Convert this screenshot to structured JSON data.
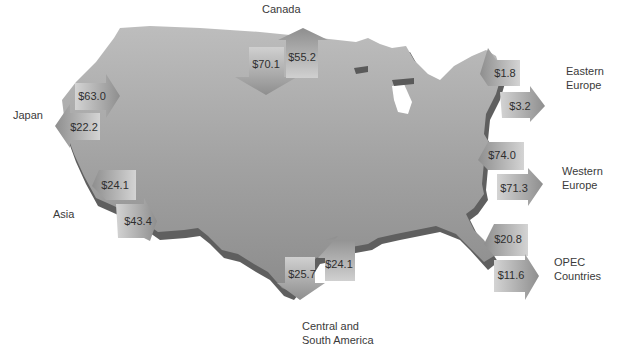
{
  "colors": {
    "map_top_light": "#b9b9b9",
    "map_top_dark": "#8f8f8f",
    "map_edge": "#6a6a6a",
    "arrow_light": "#d2d2d2",
    "arrow_dark": "#8c8c8c",
    "text": "#3a3a3a"
  },
  "regions": {
    "canada": {
      "label": "Canada"
    },
    "japan": {
      "label": "Japan"
    },
    "asia": {
      "label": "Asia"
    },
    "eastern_europe": {
      "label_line1": "Eastern",
      "label_line2": "Europe"
    },
    "western_europe": {
      "label_line1": "Western",
      "label_line2": "Europe"
    },
    "opec": {
      "label_line1": "OPEC",
      "label_line2": "Countries"
    },
    "latin_america": {
      "label_line1": "Central and",
      "label_line2": "South America"
    }
  },
  "arrows": [
    {
      "region": "Canada",
      "direction": "into US (imports)",
      "value": "$70.1"
    },
    {
      "region": "Canada",
      "direction": "out of US (exports)",
      "value": "$55.2"
    },
    {
      "region": "Japan",
      "direction": "into US (imports)",
      "value": "$63.0"
    },
    {
      "region": "Japan",
      "direction": "out of US (exports)",
      "value": "$22.2"
    },
    {
      "region": "Asia",
      "direction": "out of US (exports)",
      "value": "$24.1"
    },
    {
      "region": "Asia",
      "direction": "into US (imports)",
      "value": "$43.4"
    },
    {
      "region": "Eastern Europe",
      "direction": "into US (imports)",
      "value": "$1.8"
    },
    {
      "region": "Eastern Europe",
      "direction": "out of US (exports)",
      "value": "$3.2"
    },
    {
      "region": "Western Europe",
      "direction": "into US (imports)",
      "value": "$74.0"
    },
    {
      "region": "Western Europe",
      "direction": "out of US (exports)",
      "value": "$71.3"
    },
    {
      "region": "OPEC Countries",
      "direction": "into US (imports)",
      "value": "$20.8"
    },
    {
      "region": "OPEC Countries",
      "direction": "out of US (exports)",
      "value": "$11.6"
    },
    {
      "region": "Central and South America",
      "direction": "out of US (exports)",
      "value": "$25.7"
    },
    {
      "region": "Central and South America",
      "direction": "into US (imports)",
      "value": "$24.1"
    }
  ],
  "labels": {
    "canada_in": "$70.1",
    "canada_out": "$55.2",
    "japan_in": "$63.0",
    "japan_out": "$22.2",
    "asia_out": "$24.1",
    "asia_in": "$43.4",
    "eeur_in": "$1.8",
    "eeur_out": "$3.2",
    "weur_in": "$74.0",
    "weur_out": "$71.3",
    "opec_in": "$20.8",
    "opec_out": "$11.6",
    "latam_out": "$25.7",
    "latam_in": "$24.1"
  }
}
